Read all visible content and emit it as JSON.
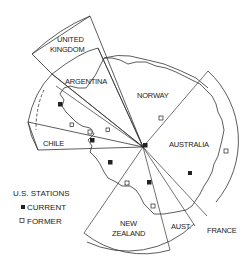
{
  "map": {
    "claims": [
      {
        "name": "UNITED KINGDOM",
        "lines": [
          "UNITED",
          "KINGDOM"
        ]
      },
      {
        "name": "ARGENTINA",
        "lines": [
          "ARGENTINA"
        ]
      },
      {
        "name": "CHILE",
        "lines": [
          "CHILE"
        ]
      },
      {
        "name": "NORWAY",
        "lines": [
          "NORWAY"
        ]
      },
      {
        "name": "AUSTRALIA",
        "lines": [
          "AUSTRALIA"
        ]
      },
      {
        "name": "NEW ZEALAND",
        "lines": [
          "NEW",
          "ZEALAND"
        ]
      },
      {
        "name": "AUST.",
        "lines": [
          "AUST."
        ]
      },
      {
        "name": "FRANCE",
        "lines": [
          "FRANCE"
        ]
      }
    ],
    "stations": {
      "current_count": 6,
      "former_count": 7
    }
  },
  "legend": {
    "title": "U.S. STATIONS",
    "items": [
      {
        "symbol": "filled-square",
        "label": "CURRENT"
      },
      {
        "symbol": "open-square",
        "label": "FORMER"
      }
    ]
  },
  "colors": {
    "ink": "#333333",
    "background": "#ffffff"
  }
}
